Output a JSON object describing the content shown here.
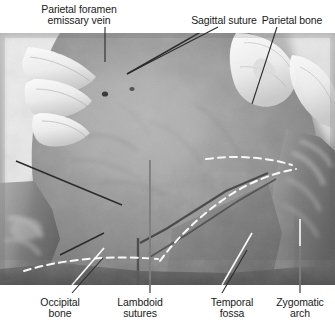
{
  "figure": {
    "kind": "anatomical-photograph",
    "view": "Posterolateral view of the skull (calvaria), soft tissue reflected",
    "modality": "color photograph, desaturated / grayscale",
    "background_color": "#ffffff",
    "text_color": "#1a1a1a",
    "photo": {
      "x": 0,
      "y": 33,
      "width": 335,
      "height": 252,
      "base_tone": "#8d8d8d",
      "elements": [
        "gloved fingers upper-left",
        "gloved fingers upper-right",
        "reflected scalp / soft tissue left margin",
        "reflected soft tissue right margin",
        "parietal foramen (dark pit)",
        "sagittal suture (dark line)",
        "lambdoid suture (dark line)",
        "temporal fossa outline (white dashed)",
        "occipital bone margin (white dashed)"
      ]
    }
  },
  "labels": {
    "top": [
      {
        "id": "parietal-foramen-emissary-vein",
        "lines": [
          "Parietal foramen",
          "emissary vein"
        ],
        "text_x": 79,
        "text_y": 4,
        "align": "center",
        "leader": {
          "type": "line",
          "x1": 105,
          "y1": 27,
          "x2": 105,
          "y2": 62,
          "color": "#2b2b2b"
        },
        "target": "parietal foramen"
      },
      {
        "id": "sagittal-suture",
        "lines": [
          "Sagittal suture"
        ],
        "text_x": 224,
        "text_y": 15,
        "align": "center",
        "leader": {
          "type": "line",
          "x1": 218,
          "y1": 27,
          "x2": 127,
          "y2": 74,
          "color": "#2b2b2b"
        },
        "target": "sagittal suture"
      },
      {
        "id": "parietal-bone",
        "lines": [
          "Parietal bone"
        ],
        "text_x": 300,
        "text_y": 15,
        "align": "center",
        "leader": {
          "type": "line",
          "x1": 277,
          "y1": 27,
          "x2": 252,
          "y2": 104,
          "color": "#2b2b2b"
        },
        "target": "parietal bone"
      }
    ],
    "bottom": [
      {
        "id": "occipital-bone",
        "lines": [
          "Occipital",
          "bone"
        ],
        "text_x": 60,
        "text_y": 297,
        "align": "center",
        "leader": {
          "type": "line",
          "x1": 72,
          "y1": 293,
          "x2": 103,
          "y2": 258,
          "color": "#2b2b2b"
        },
        "target": "occipital bone"
      },
      {
        "id": "lambdoid-sutures",
        "lines": [
          "Lambdoid",
          "sutures"
        ],
        "text_x": 140,
        "text_y": 297,
        "align": "center",
        "leader": {
          "type": "line",
          "x1": 150,
          "y1": 293,
          "x2": 150,
          "y2": 160,
          "color": "#2b2b2b"
        },
        "target": "lambdoid sutures"
      },
      {
        "id": "temporal-fossa",
        "lines": [
          "Temporal",
          "fossa"
        ],
        "text_x": 232,
        "text_y": 297,
        "align": "center",
        "leader": {
          "type": "line",
          "x1": 222,
          "y1": 293,
          "x2": 247,
          "y2": 250,
          "color": "#2b2b2b"
        },
        "target": "temporal fossa"
      },
      {
        "id": "zygomatic-arch",
        "lines": [
          "Zygomatic",
          "arch"
        ],
        "text_x": 300,
        "text_y": 297,
        "align": "center",
        "leader": {
          "type": "line",
          "x1": 300,
          "y1": 293,
          "x2": 300,
          "y2": 246,
          "color": "#2b2b2b"
        },
        "target": "zygomatic arch"
      }
    ]
  }
}
